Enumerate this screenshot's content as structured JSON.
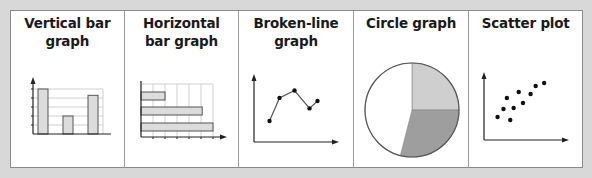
{
  "panels": [
    {
      "title_line1": "Vertical bar",
      "title_line2": "graph",
      "icon": "vertical-bar-graph"
    },
    {
      "title_line1": "Horizontal",
      "title_line2": "bar graph",
      "icon": "horizontal-bar-graph"
    },
    {
      "title_line1": "Broken-line",
      "title_line2": "graph",
      "icon": "broken-line-graph"
    },
    {
      "title_line1": "Circle graph",
      "title_line2": "",
      "icon": "circle-graph"
    },
    {
      "title_line1": "Scatter plot",
      "title_line2": "",
      "icon": "scatter-plot"
    }
  ],
  "colors": {
    "bar_fill": "#dcdcdc",
    "bar_stroke": "#555555",
    "grid": "#d0d0d0",
    "axis": "#222222",
    "pie_light": "#cfcfcf",
    "pie_dark": "#9e9e9e",
    "pie_white": "#ffffff"
  },
  "chart_data": [
    {
      "type": "bar",
      "orientation": "vertical",
      "title": "Vertical bar graph",
      "categories": [
        "1",
        "2",
        "3"
      ],
      "values": [
        5,
        2,
        4.3
      ],
      "ylim": [
        0,
        5
      ],
      "grid": true
    },
    {
      "type": "bar",
      "orientation": "horizontal",
      "title": "Horizontal bar graph",
      "categories": [
        "1",
        "2",
        "3"
      ],
      "values": [
        2,
        5.1,
        6
      ],
      "xlim": [
        0,
        6
      ],
      "grid": true
    },
    {
      "type": "line",
      "title": "Broken-line graph",
      "x": [
        1,
        2,
        3,
        4,
        5
      ],
      "y": [
        2,
        4.2,
        4.9,
        3.2,
        3.9
      ],
      "xlim": [
        0,
        6
      ],
      "ylim": [
        0,
        7
      ],
      "grid": false
    },
    {
      "type": "pie",
      "title": "Circle graph",
      "values": [
        25,
        29,
        46
      ],
      "slice_colors": [
        "light",
        "dark",
        "white"
      ]
    },
    {
      "type": "scatter",
      "title": "Scatter plot",
      "x": [
        1.6,
        2.3,
        2.7,
        3.1,
        3.5,
        4.1,
        4.6,
        5.5,
        6.1,
        7.1
      ],
      "y": [
        2.3,
        3.1,
        4.2,
        2.0,
        3.2,
        4.8,
        3.7,
        4.6,
        5.4,
        5.7
      ],
      "xlim": [
        0,
        8.5
      ],
      "ylim": [
        0,
        6.7
      ],
      "grid": false
    }
  ]
}
